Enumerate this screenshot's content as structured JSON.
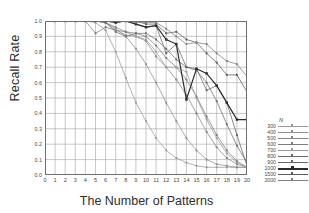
{
  "chart_data": {
    "type": "line",
    "title": "",
    "xlabel": "The Number of Patterns",
    "ylabel": "Recall Rate",
    "xlim": [
      0,
      20
    ],
    "ylim": [
      0.0,
      1.0
    ],
    "grid": true,
    "legend_position": "right",
    "legend_title": "N",
    "xticks": [
      "0",
      "1",
      "2",
      "3",
      "4",
      "5",
      "6",
      "7",
      "8",
      "9",
      "10",
      "11",
      "12",
      "13",
      "14",
      "15",
      "16",
      "17",
      "18",
      "19",
      "20"
    ],
    "yticks": [
      "0.0",
      "0.1",
      "0.2",
      "0.3",
      "0.4",
      "0.5",
      "0.6",
      "0.7",
      "0.8",
      "0.9",
      "1.0"
    ],
    "x": [
      1,
      2,
      3,
      4,
      5,
      6,
      7,
      8,
      9,
      10,
      11,
      12,
      13,
      14,
      15,
      16,
      17,
      18,
      19,
      20
    ],
    "series": [
      {
        "name": "300",
        "color": "#9a9a9a",
        "values": [
          1.0,
          1.0,
          1.0,
          1.0,
          0.99,
          0.94,
          0.8,
          0.63,
          0.47,
          0.35,
          0.24,
          0.16,
          0.11,
          0.08,
          0.06,
          0.05,
          0.05,
          0.05,
          0.05,
          0.05
        ]
      },
      {
        "name": "400",
        "color": "#8f8f8f",
        "values": [
          1.0,
          1.0,
          1.0,
          1.0,
          1.0,
          0.99,
          0.95,
          0.9,
          0.82,
          0.72,
          0.6,
          0.47,
          0.35,
          0.24,
          0.16,
          0.1,
          0.07,
          0.06,
          0.05,
          0.05
        ]
      },
      {
        "name": "500",
        "color": "#858585",
        "values": [
          1.0,
          1.0,
          1.0,
          1.0,
          1.0,
          0.99,
          0.96,
          0.93,
          0.9,
          0.87,
          0.77,
          0.7,
          0.62,
          0.52,
          0.4,
          0.28,
          0.18,
          0.11,
          0.07,
          0.05
        ]
      },
      {
        "name": "600",
        "color": "#7b7b7b",
        "values": [
          1.0,
          1.0,
          1.0,
          1.0,
          0.92,
          0.96,
          0.94,
          0.93,
          0.92,
          0.9,
          0.84,
          0.76,
          0.7,
          0.62,
          0.51,
          0.38,
          0.26,
          0.16,
          0.09,
          0.05
        ]
      },
      {
        "name": "700",
        "color": "#9c9c9c",
        "values": [
          1.0,
          1.0,
          1.0,
          1.0,
          1.0,
          0.99,
          0.94,
          0.91,
          0.9,
          0.88,
          0.8,
          0.7,
          0.7,
          0.67,
          0.5,
          0.36,
          0.24,
          0.14,
          0.08,
          0.05
        ]
      },
      {
        "name": "800",
        "color": "#6d6d6d",
        "values": [
          1.0,
          1.0,
          1.0,
          1.0,
          1.0,
          0.99,
          0.93,
          0.9,
          0.92,
          0.92,
          0.88,
          0.82,
          0.75,
          0.7,
          0.68,
          0.6,
          0.48,
          0.33,
          0.19,
          0.08
        ]
      },
      {
        "name": "900",
        "color": "#646464",
        "values": [
          1.0,
          1.0,
          1.0,
          1.0,
          1.0,
          1.0,
          0.99,
          1.0,
          0.98,
          0.96,
          0.97,
          0.79,
          0.85,
          0.7,
          0.69,
          0.55,
          0.58,
          0.47,
          0.26,
          0.06
        ]
      },
      {
        "name": "1000",
        "color": "#2b2b2b",
        "values": [
          1.0,
          1.0,
          1.0,
          1.0,
          1.0,
          1.0,
          0.99,
          1.0,
          0.98,
          0.96,
          0.97,
          0.88,
          0.85,
          0.49,
          0.69,
          0.66,
          0.58,
          0.47,
          0.36,
          0.36
        ]
      },
      {
        "name": "1500",
        "color": "#5a5a5a",
        "values": [
          1.0,
          1.0,
          1.0,
          1.0,
          1.0,
          1.0,
          1.0,
          1.0,
          1.0,
          0.98,
          0.98,
          0.92,
          0.93,
          0.88,
          0.86,
          0.79,
          0.73,
          0.65,
          0.65,
          0.54
        ]
      },
      {
        "name": "2000",
        "color": "#808080",
        "values": [
          1.0,
          1.0,
          1.0,
          1.0,
          1.0,
          1.0,
          1.0,
          1.0,
          0.99,
          0.99,
          0.99,
          0.95,
          0.9,
          0.85,
          0.86,
          0.85,
          0.79,
          0.74,
          0.72,
          0.64
        ]
      }
    ]
  },
  "axes": {
    "xlabel": "The Number of Patterns",
    "ylabel": "Recall Rate"
  },
  "legend": {
    "title": "N"
  }
}
